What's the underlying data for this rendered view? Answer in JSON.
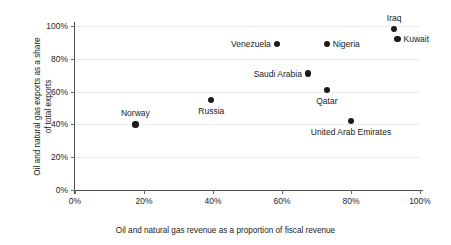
{
  "chart_data": {
    "type": "scatter",
    "title": "",
    "xlabel": "Oil and natural gas revenue as a proportion of fiscal revenue",
    "ylabel_lines": [
      "Oil and natural gas exports as a share",
      "of total exports"
    ],
    "xlim": [
      0,
      100
    ],
    "ylim": [
      0,
      100
    ],
    "xticks": [
      "0%",
      "20%",
      "40%",
      "60%",
      "80%",
      "100%"
    ],
    "xtick_values": [
      0,
      20,
      40,
      60,
      80,
      100
    ],
    "yticks": [
      "0%",
      "20%",
      "40%",
      "60%",
      "80%",
      "100%"
    ],
    "ytick_values": [
      0,
      20,
      40,
      60,
      80,
      100
    ],
    "grid": "horizontal",
    "legend": "none",
    "marker_color": "#1a1a1a",
    "points": [
      {
        "label": "Norway",
        "x": 17.5,
        "y": 40,
        "label_pos": "above"
      },
      {
        "label": "Russia",
        "x": 39.5,
        "y": 55,
        "label_pos": "below"
      },
      {
        "label": "Venezuela",
        "x": 58.5,
        "y": 89,
        "label_pos": "left"
      },
      {
        "label": "Saudi Arabia",
        "x": 67.5,
        "y": 71,
        "label_pos": "left"
      },
      {
        "label": "Qatar",
        "x": 73.0,
        "y": 61,
        "label_pos": "below"
      },
      {
        "label": "Nigeria",
        "x": 73.0,
        "y": 89,
        "label_pos": "right"
      },
      {
        "label": "United Arab Emirates",
        "x": 80.0,
        "y": 42,
        "label_pos": "below"
      },
      {
        "label": "Iraq",
        "x": 92.5,
        "y": 98,
        "label_pos": "above"
      },
      {
        "label": "Kuwait",
        "x": 93.5,
        "y": 92,
        "label_pos": "right"
      }
    ]
  }
}
